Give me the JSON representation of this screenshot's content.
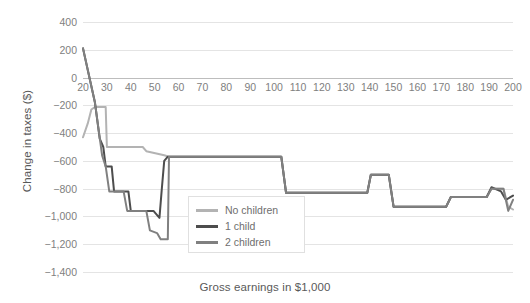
{
  "chart_data": {
    "type": "line",
    "title": "",
    "xlabel": "Gross earnings in $1,000",
    "ylabel": "Change in taxes ($)",
    "xlim": [
      20,
      200
    ],
    "ylim": [
      -1400,
      400
    ],
    "grid": true,
    "legend_position": "center",
    "xticks": [
      "20",
      "30",
      "40",
      "50",
      "60",
      "70",
      "80",
      "90",
      "100",
      "110",
      "120",
      "130",
      "140",
      "150",
      "160",
      "170",
      "180",
      "190",
      "200"
    ],
    "yticks": [
      "400",
      "200",
      "0",
      "-200",
      "-400",
      "-600",
      "-800",
      "-1,000",
      "-1,200",
      "-1,400"
    ],
    "colors": {
      "no_children": "#b3b3b3",
      "one_child": "#4d4d4d",
      "two_children": "#808080",
      "gridline": "#e4e4e4",
      "zeroline": "#bdbdbd",
      "text": "#808080"
    },
    "series": [
      {
        "name": "No children",
        "color": "#b3b3b3",
        "points": [
          [
            20,
            -430
          ],
          [
            22,
            -330
          ],
          [
            23.5,
            -230
          ],
          [
            25,
            -212
          ],
          [
            29.5,
            -212
          ],
          [
            30,
            -500
          ],
          [
            45,
            -500
          ],
          [
            46.5,
            -530
          ],
          [
            54,
            -560
          ],
          [
            56,
            -570
          ],
          [
            103,
            -570
          ],
          [
            105,
            -830
          ],
          [
            139,
            -830
          ],
          [
            140.5,
            -700
          ],
          [
            148,
            -700
          ],
          [
            150,
            -930
          ],
          [
            172,
            -930
          ],
          [
            174,
            -860
          ],
          [
            189,
            -860
          ],
          [
            191,
            -800
          ],
          [
            196,
            -800
          ],
          [
            198,
            -930
          ],
          [
            200,
            -950
          ]
        ]
      },
      {
        "name": "1 child",
        "color": "#4d4d4d",
        "points": [
          [
            20,
            210
          ],
          [
            25,
            -180
          ],
          [
            27,
            -440
          ],
          [
            28.5,
            -500
          ],
          [
            29.5,
            -640
          ],
          [
            32,
            -640
          ],
          [
            33,
            -820
          ],
          [
            39,
            -820
          ],
          [
            40,
            -960
          ],
          [
            48,
            -960
          ],
          [
            49.5,
            -960
          ],
          [
            52,
            -1010
          ],
          [
            53,
            -800
          ],
          [
            54,
            -600
          ],
          [
            55.5,
            -570
          ],
          [
            103,
            -570
          ],
          [
            105,
            -830
          ],
          [
            139,
            -830
          ],
          [
            140.5,
            -700
          ],
          [
            148,
            -700
          ],
          [
            150,
            -930
          ],
          [
            172,
            -930
          ],
          [
            174,
            -860
          ],
          [
            189,
            -860
          ],
          [
            191,
            -790
          ],
          [
            195,
            -820
          ],
          [
            197,
            -880
          ],
          [
            200,
            -850
          ]
        ]
      },
      {
        "name": "2 children",
        "color": "#808080",
        "points": [
          [
            20,
            210
          ],
          [
            25,
            -180
          ],
          [
            28,
            -560
          ],
          [
            29.5,
            -640
          ],
          [
            31,
            -820
          ],
          [
            37,
            -820
          ],
          [
            38.5,
            -960
          ],
          [
            46.5,
            -960
          ],
          [
            48,
            -1100
          ],
          [
            51,
            -1120
          ],
          [
            52.5,
            -1165
          ],
          [
            55.5,
            -1165
          ],
          [
            56,
            -570
          ],
          [
            103,
            -570
          ],
          [
            105,
            -830
          ],
          [
            139,
            -830
          ],
          [
            140.5,
            -700
          ],
          [
            148,
            -700
          ],
          [
            150,
            -930
          ],
          [
            172,
            -930
          ],
          [
            174,
            -860
          ],
          [
            189,
            -860
          ],
          [
            191,
            -800
          ],
          [
            196,
            -800
          ],
          [
            198,
            -960
          ],
          [
            200,
            -880
          ]
        ]
      }
    ]
  },
  "legend": {
    "items": [
      {
        "label": "No children",
        "color": "#b3b3b3"
      },
      {
        "label": "1 child",
        "color": "#4d4d4d"
      },
      {
        "label": "2 children",
        "color": "#808080"
      }
    ]
  }
}
